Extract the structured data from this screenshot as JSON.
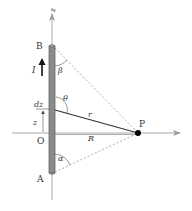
{
  "figure": {
    "labels": {
      "z_axis": "z",
      "top_end": "B",
      "bottom_end": "A",
      "current": "I",
      "element": "dz",
      "height": "z",
      "origin": "O",
      "distance_r": "r",
      "perp_distance": "R",
      "point": "P",
      "angle_theta": "θ",
      "angle_beta": "β",
      "angle_alpha": "α"
    },
    "colors": {
      "rod_fill": "#8a8a8a",
      "rod_edge": "#555555",
      "axis": "#aaaaaa",
      "line": "#333333",
      "dashed": "#999999",
      "point": "#000000"
    }
  }
}
